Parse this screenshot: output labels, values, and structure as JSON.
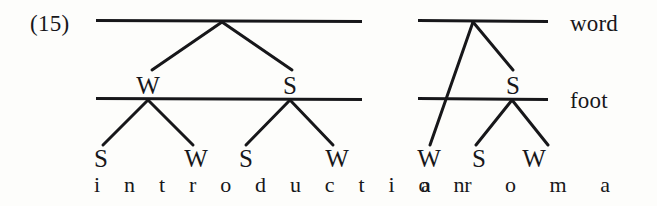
{
  "figure": {
    "example_number": "(15)",
    "tier_labels": {
      "word": "word",
      "foot": "foot"
    }
  },
  "trees": [
    {
      "id": "introduction-tree",
      "word_text": "i n t r o d u c t i o n",
      "word_plain": "introduction",
      "foot_level_labels": [
        "W",
        "S"
      ],
      "syllable_level_labels": [
        "S",
        "W",
        "S",
        "W"
      ]
    },
    {
      "id": "aroma-tree",
      "word_text": "a r o m a",
      "word_plain": "aroma",
      "foot_level_labels": [
        "S"
      ],
      "syllable_level_labels": [
        "W",
        "S",
        "W"
      ]
    }
  ],
  "style": {
    "ink_color": "#17171a",
    "background_color": "#fdfdfb"
  },
  "geometry": {
    "word_tier_y": 21,
    "foot_tier_y": 99,
    "left_tier_line_start_x": 96,
    "left_tier_line_end_x": 362,
    "right_tier_line_start_x": 418,
    "right_tier_line_end_x": 548,
    "left_word_apex_x": 222,
    "right_word_apex_x": 473,
    "left_foot_apex_xs": [
      148,
      290
    ],
    "right_foot_apex_x": 512,
    "syllable_label_y": 158,
    "word_text_y": 185
  }
}
